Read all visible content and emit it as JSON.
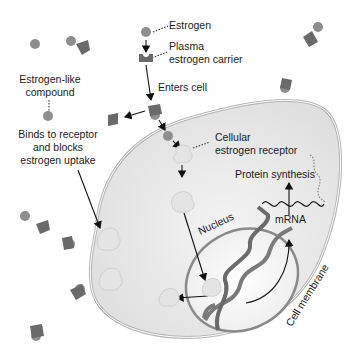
{
  "diagram": {
    "labels": {
      "estrogen": "Estrogen",
      "plasma_carrier_1": "Plasma",
      "plasma_carrier_2": "estrogen carrier",
      "enters_cell": "Enters cell",
      "estrogen_like_1": "Estrogen-like",
      "estrogen_like_2": "compound",
      "binds_1": "Binds to receptor",
      "binds_2": "and blocks",
      "binds_3": "estrogen uptake",
      "cellular_receptor_1": "Cellular",
      "cellular_receptor_2": "estrogen receptor",
      "protein_synthesis": "Protein synthesis",
      "mrna": "mRNA",
      "nucleus": "Nucleus",
      "cell_membrane": "Cell membrane"
    },
    "colors": {
      "molecule": "#8e8e8e",
      "carrier": "#6a6a6a",
      "receptor": "#e4e4e4",
      "cytoplasm": "#ececec",
      "membrane": "#b8b8b8",
      "dna": "#7a7a7a",
      "arrow": "#111111"
    }
  }
}
